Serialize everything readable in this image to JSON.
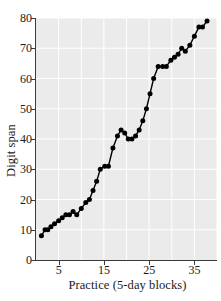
{
  "chart_data": {
    "type": "line",
    "title": "",
    "subtitle": "",
    "xlabel": "Practice (5-day blocks)",
    "ylabel": "Digit span",
    "xlim": [
      0,
      40
    ],
    "ylim": [
      0,
      80
    ],
    "xticks": [
      5,
      15,
      25,
      35
    ],
    "yticks": [
      0,
      10,
      20,
      30,
      40,
      50,
      60,
      70,
      80
    ],
    "grid": true,
    "legend": "none",
    "marker": "filled-circle",
    "marker_color": "#000000",
    "line_color": "#000000",
    "plot_background": "#ebebeb",
    "gridline_color": "#ffffff",
    "x": [
      1,
      2,
      3,
      4,
      5,
      6,
      7,
      8,
      9,
      10,
      11,
      12,
      13,
      14,
      15,
      16,
      17,
      18,
      19,
      20,
      21,
      22,
      23,
      24,
      25,
      26,
      27,
      28,
      29,
      30,
      31,
      32,
      33,
      34,
      35,
      36,
      37,
      38
    ],
    "values": [
      8,
      10,
      10,
      11,
      12,
      13,
      14,
      15,
      15,
      16,
      15,
      17,
      19,
      20,
      23,
      26,
      30,
      31,
      31,
      37,
      41,
      43,
      42,
      40,
      40,
      41,
      43,
      46,
      50,
      55,
      60,
      64,
      64,
      64,
      66,
      68,
      70,
      69
    ],
    "series": [
      {
        "name": "Digit span",
        "x": [
          1,
          2,
          3,
          4,
          5,
          6,
          7,
          8,
          9,
          10,
          11,
          12,
          13,
          14,
          15,
          16,
          17,
          18,
          19,
          20,
          21,
          22,
          23,
          24,
          25,
          26,
          27,
          28,
          29,
          30,
          31,
          32,
          33,
          34,
          35,
          36,
          37,
          38,
          39,
          40
        ],
        "values": [
          8,
          10,
          10,
          11,
          12,
          13,
          14,
          15,
          15,
          16,
          15,
          17,
          19,
          20,
          23,
          26,
          30,
          31,
          31,
          37,
          41,
          43,
          42,
          40,
          40,
          41,
          43,
          46,
          50,
          55,
          60,
          64,
          64,
          64,
          66,
          70,
          69,
          71,
          77,
          79
        ]
      }
    ],
    "points": [
      {
        "x": 1.2,
        "y": 8
      },
      {
        "x": 2.0,
        "y": 10
      },
      {
        "x": 2.6,
        "y": 10
      },
      {
        "x": 3.3,
        "y": 11
      },
      {
        "x": 4.1,
        "y": 12
      },
      {
        "x": 5.0,
        "y": 13
      },
      {
        "x": 5.8,
        "y": 14
      },
      {
        "x": 6.6,
        "y": 15
      },
      {
        "x": 7.4,
        "y": 15
      },
      {
        "x": 8.2,
        "y": 16
      },
      {
        "x": 9.0,
        "y": 15
      },
      {
        "x": 10.0,
        "y": 17
      },
      {
        "x": 11.0,
        "y": 19
      },
      {
        "x": 11.8,
        "y": 20
      },
      {
        "x": 12.6,
        "y": 23
      },
      {
        "x": 13.4,
        "y": 26
      },
      {
        "x": 14.2,
        "y": 30
      },
      {
        "x": 15.2,
        "y": 31
      },
      {
        "x": 16.0,
        "y": 31
      },
      {
        "x": 17.0,
        "y": 37
      },
      {
        "x": 18.0,
        "y": 41
      },
      {
        "x": 18.8,
        "y": 43
      },
      {
        "x": 19.6,
        "y": 42
      },
      {
        "x": 20.4,
        "y": 40
      },
      {
        "x": 21.2,
        "y": 40
      },
      {
        "x": 22.0,
        "y": 41
      },
      {
        "x": 22.8,
        "y": 43
      },
      {
        "x": 23.6,
        "y": 46
      },
      {
        "x": 24.4,
        "y": 50
      },
      {
        "x": 25.2,
        "y": 55
      },
      {
        "x": 26.0,
        "y": 60
      },
      {
        "x": 27.0,
        "y": 64
      },
      {
        "x": 28.0,
        "y": 64
      },
      {
        "x": 28.8,
        "y": 64
      },
      {
        "x": 29.8,
        "y": 66
      },
      {
        "x": 30.6,
        "y": 67
      },
      {
        "x": 31.4,
        "y": 68
      },
      {
        "x": 32.2,
        "y": 70
      },
      {
        "x": 33.0,
        "y": 69
      },
      {
        "x": 34.0,
        "y": 71
      },
      {
        "x": 35.0,
        "y": 74
      },
      {
        "x": 36.0,
        "y": 77
      },
      {
        "x": 36.8,
        "y": 77
      },
      {
        "x": 37.8,
        "y": 79
      }
    ]
  },
  "axis": {
    "ylabel": "Digit span",
    "xlabel": "Practice (5-day blocks)",
    "ytick_labels": [
      "0",
      "10",
      "20",
      "30",
      "40",
      "50",
      "60",
      "70",
      "80"
    ],
    "xtick_labels": [
      "5",
      "15",
      "25",
      "35"
    ]
  }
}
